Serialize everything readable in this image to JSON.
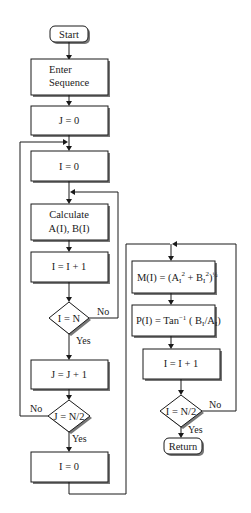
{
  "diagram": {
    "type": "flowchart",
    "nodes": {
      "start": "Start",
      "enter1": "Enter",
      "enter2": "Sequence",
      "j0": "J = 0",
      "i0": "I = 0",
      "calc1": "Calculate",
      "calc2": "A(I), B(I)",
      "iinc": "I = I + 1",
      "dec_in": "I = N",
      "jinc": "J = J + 1",
      "dec_jn": "J = N/2",
      "i0b": "I = 0",
      "m_lhs": "M(I) = (A",
      "m_sub1": "I",
      "m_sup1": "2",
      "m_mid": " + B",
      "m_sub2": "I",
      "m_sup2": "2",
      "m_close": ")",
      "m_sup3": "½",
      "p_lhs": "P(I) = Tan",
      "p_sup": "−1",
      "p_mid": " ( B",
      "p_sub1": "I",
      "p_slash": "/A",
      "p_sub2": "I",
      "p_close": ")",
      "iinc2": "I = I + 1",
      "dec_in2": "I = N/2",
      "ret": "Return"
    },
    "labels": {
      "no1": "No",
      "yes1": "Yes",
      "no2": "No",
      "yes2": "Yes",
      "no3": "No",
      "yes3": "Yes"
    }
  }
}
